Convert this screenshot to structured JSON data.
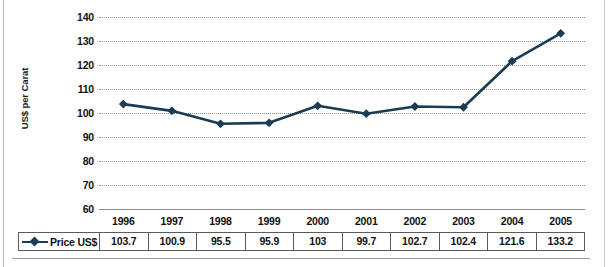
{
  "chart_data": {
    "type": "line",
    "title": "",
    "xlabel": "",
    "ylabel": "US$ per Carat",
    "categories": [
      "1996",
      "1997",
      "1998",
      "1999",
      "2000",
      "2001",
      "2002",
      "2003",
      "2004",
      "2005"
    ],
    "values": [
      103.7,
      100.9,
      95.5,
      95.9,
      103,
      99.7,
      102.7,
      102.4,
      121.6,
      133.2
    ],
    "series": [
      {
        "name": "Price US$",
        "values": [
          103.7,
          100.9,
          95.5,
          95.9,
          103,
          99.7,
          102.7,
          102.4,
          121.6,
          133.2
        ]
      }
    ],
    "yticks": [
      140,
      130,
      120,
      110,
      100,
      90,
      80,
      70,
      60
    ],
    "ylim": [
      60,
      140
    ],
    "grid": true,
    "legend_position": "bottom-table",
    "marker": "diamond",
    "line_color": "#1b3c53",
    "grid_color": "#8e8e8e"
  },
  "axis": {
    "y_title": "US$ per Carat",
    "y_ticks": [
      "140",
      "130",
      "120",
      "110",
      "100",
      "90",
      "80",
      "70",
      "60"
    ],
    "x_ticks": [
      "1996",
      "1997",
      "1998",
      "1999",
      "2000",
      "2001",
      "2002",
      "2003",
      "2004",
      "2005"
    ]
  },
  "table": {
    "legend_label": "Price US$",
    "row_values": [
      "103.7",
      "100.9",
      "95.5",
      "95.9",
      "103",
      "99.7",
      "102.7",
      "102.4",
      "121.6",
      "133.2"
    ]
  },
  "colors": {
    "line": "#1b3c53",
    "marker": "#1b3c53",
    "gridline": "#8e8e8e",
    "table_border": "#5a5a5a",
    "text": "#111111"
  }
}
